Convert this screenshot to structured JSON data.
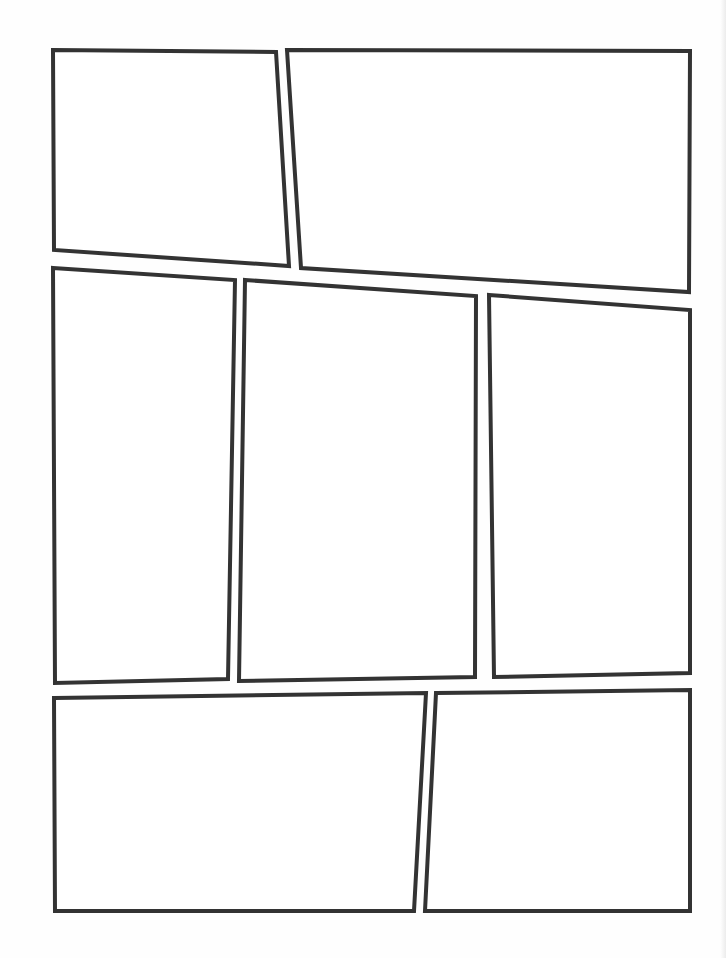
{
  "page": {
    "type": "comic-page-layout-template",
    "background": "#fefefe",
    "border_color": "#333333",
    "border_width": 4,
    "panel_count": 7,
    "rows": 3
  },
  "panels": [
    {
      "id": 1,
      "row": 1,
      "points": "53,50 276,52 289,266 54,250"
    },
    {
      "id": 2,
      "row": 1,
      "points": "287,50 690,51 689,292 301,268"
    },
    {
      "id": 3,
      "row": 2,
      "points": "53,268 235,280 228,679 55,683"
    },
    {
      "id": 4,
      "row": 2,
      "points": "245,280 476,296 475,677 239,681"
    },
    {
      "id": 5,
      "row": 2,
      "points": "489,295 690,310 690,673 494,677"
    },
    {
      "id": 6,
      "row": 3,
      "points": "54,698 426,693 414,911 55,911"
    },
    {
      "id": 7,
      "row": 3,
      "points": "436,693 690,690 690,911 425,911"
    }
  ]
}
